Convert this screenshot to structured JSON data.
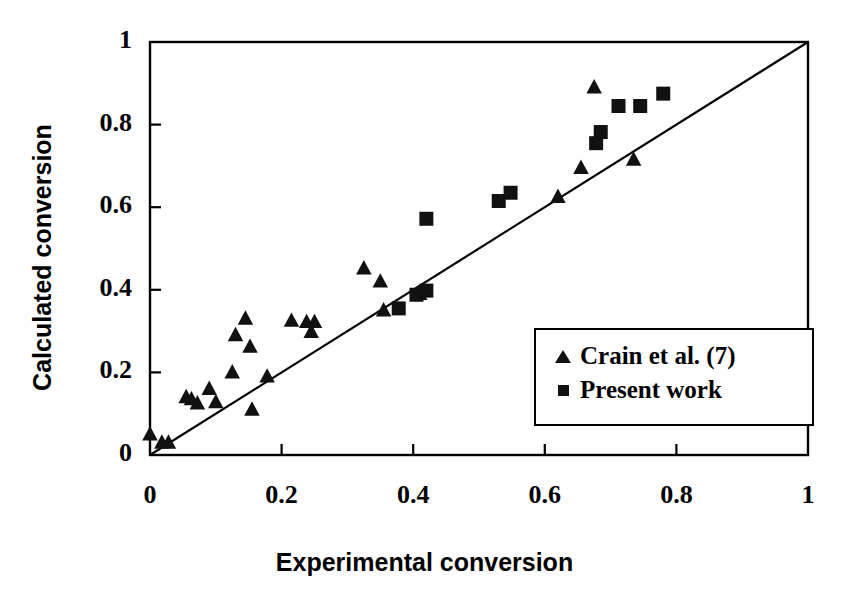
{
  "figure": {
    "title": "",
    "background_color": "#ffffff",
    "marker_color": "#111111",
    "axis_color": "#000000"
  },
  "axes": {
    "xlabel": "Experimental conversion",
    "ylabel": "Calculated conversion",
    "xlim": [
      0,
      1
    ],
    "ylim": [
      0,
      1
    ],
    "xticks": [
      "0",
      "0.2",
      "0.4",
      "0.6",
      "0.8",
      "1"
    ],
    "yticks": [
      "0",
      "0.2",
      "0.4",
      "0.6",
      "0.8",
      "1"
    ],
    "xtick_values": [
      0,
      0.2,
      0.4,
      0.6,
      0.8,
      1
    ],
    "ytick_values": [
      0,
      0.2,
      0.4,
      0.6,
      0.8,
      1
    ],
    "grid": false
  },
  "legend": {
    "position": "lower-right-inside",
    "entries": [
      {
        "label": "Crain et al. (7)",
        "marker": "triangle"
      },
      {
        "label": "Present work",
        "marker": "square"
      }
    ]
  },
  "chart_data": {
    "type": "scatter",
    "title": "",
    "xlabel": "Experimental conversion",
    "ylabel": "Calculated conversion",
    "xlim": [
      0,
      1
    ],
    "ylim": [
      0,
      1
    ],
    "grid": false,
    "legend_position": "lower-right-inside",
    "annotations": [
      {
        "type": "line",
        "name": "parity-line",
        "label": "y = x",
        "from": [
          0,
          0
        ],
        "to": [
          1,
          1
        ]
      }
    ],
    "series": [
      {
        "name": "Crain et al. (7)",
        "marker": "triangle",
        "color": "#111111",
        "points": [
          [
            0.0,
            0.05
          ],
          [
            0.018,
            0.03
          ],
          [
            0.028,
            0.03
          ],
          [
            0.055,
            0.14
          ],
          [
            0.063,
            0.135
          ],
          [
            0.072,
            0.125
          ],
          [
            0.09,
            0.16
          ],
          [
            0.1,
            0.128
          ],
          [
            0.125,
            0.2
          ],
          [
            0.13,
            0.29
          ],
          [
            0.145,
            0.33
          ],
          [
            0.152,
            0.262
          ],
          [
            0.155,
            0.11
          ],
          [
            0.178,
            0.19
          ],
          [
            0.215,
            0.325
          ],
          [
            0.238,
            0.322
          ],
          [
            0.245,
            0.298
          ],
          [
            0.25,
            0.322
          ],
          [
            0.325,
            0.452
          ],
          [
            0.35,
            0.42
          ],
          [
            0.355,
            0.35
          ],
          [
            0.41,
            0.39
          ],
          [
            0.62,
            0.625
          ],
          [
            0.655,
            0.695
          ],
          [
            0.675,
            0.89
          ],
          [
            0.735,
            0.715
          ]
        ]
      },
      {
        "name": "Present work",
        "marker": "square",
        "color": "#111111",
        "points": [
          [
            0.378,
            0.355
          ],
          [
            0.405,
            0.388
          ],
          [
            0.42,
            0.398
          ],
          [
            0.42,
            0.572
          ],
          [
            0.53,
            0.615
          ],
          [
            0.548,
            0.635
          ],
          [
            0.678,
            0.755
          ],
          [
            0.685,
            0.782
          ],
          [
            0.712,
            0.845
          ],
          [
            0.745,
            0.845
          ],
          [
            0.78,
            0.875
          ]
        ]
      }
    ]
  }
}
